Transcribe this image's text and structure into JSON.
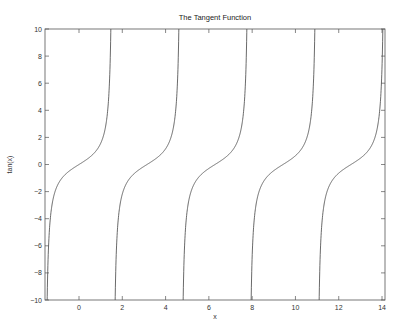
{
  "chart_data": {
    "type": "line",
    "title": "The Tangent Function",
    "xlabel": "x",
    "ylabel": "tan(x)",
    "function": "tan(x)",
    "xlim": [
      -1.5708,
      14.1372
    ],
    "ylim": [
      -10,
      10
    ],
    "xticks": [
      0,
      2,
      4,
      6,
      8,
      10,
      12,
      14
    ],
    "xtick_labels": [
      "0",
      "2",
      "4",
      "6",
      "8",
      "10",
      "12",
      "14"
    ],
    "yticks": [
      -10,
      -8,
      -6,
      -4,
      -2,
      0,
      2,
      4,
      6,
      8,
      10
    ],
    "ytick_labels": [
      "-10",
      "-8",
      "-6",
      "-4",
      "-2",
      "0",
      "2",
      "4",
      "6",
      "8",
      "10"
    ],
    "asymptotes": [
      1.5708,
      4.7124,
      7.854,
      10.9956
    ],
    "grid": false,
    "series": [
      {
        "name": "tan(x)",
        "color": "#444444",
        "branches": [
          {
            "x_range": [
              -1.5708,
              1.5708
            ]
          },
          {
            "x_range": [
              1.5708,
              4.7124
            ]
          },
          {
            "x_range": [
              4.7124,
              7.854
            ]
          },
          {
            "x_range": [
              7.854,
              10.9956
            ]
          },
          {
            "x_range": [
              10.9956,
              14.1372
            ]
          }
        ],
        "sample_points": [
          {
            "x": -1.4711,
            "y": -10
          },
          {
            "x": -1.1071,
            "y": -2
          },
          {
            "x": -0.7854,
            "y": -1
          },
          {
            "x": 0,
            "y": 0
          },
          {
            "x": 0.7854,
            "y": 1
          },
          {
            "x": 1.1071,
            "y": 2
          },
          {
            "x": 1.4711,
            "y": 10
          }
        ]
      }
    ]
  }
}
